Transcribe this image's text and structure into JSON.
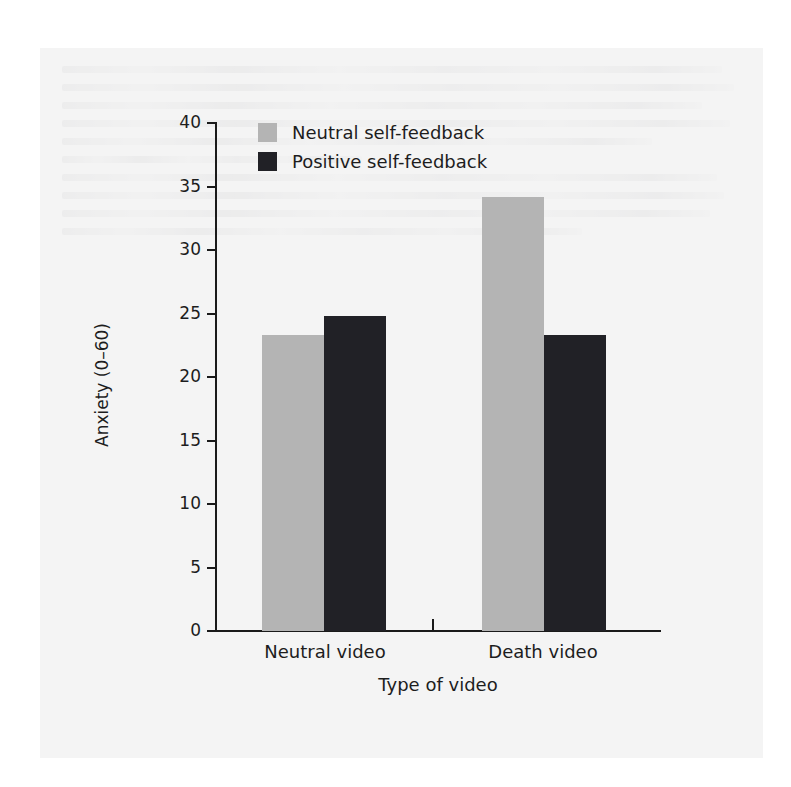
{
  "chart_data": {
    "type": "bar",
    "title": "",
    "xlabel": "Type of video",
    "ylabel": "Anxiety (0–60)",
    "categories": [
      "Neutral video",
      "Death video"
    ],
    "series": [
      {
        "name": "Neutral self-feedback",
        "color": "#b4b4b4",
        "values": [
          23.3,
          34.2
        ]
      },
      {
        "name": "Positive self-feedback",
        "color": "#212126",
        "values": [
          24.8,
          23.3
        ]
      }
    ],
    "ylim": [
      0,
      40
    ],
    "yticks": [
      0,
      5,
      10,
      15,
      20,
      25,
      30,
      35,
      40
    ],
    "ytick_labels": [
      "0",
      "5",
      "10",
      "15",
      "20",
      "25",
      "30",
      "35",
      "40"
    ],
    "grid": false,
    "legend_position": "top-left-inside",
    "axis_color": "#1a1a1a",
    "background_color": "#f4f4f4"
  },
  "legend": {
    "entries": [
      {
        "label": "Neutral self-feedback",
        "color": "#b4b4b4"
      },
      {
        "label": "Positive self-feedback",
        "color": "#212126"
      }
    ]
  },
  "axes": {
    "y_title": "Anxiety (0–60)",
    "x_title": "Type of video",
    "y_ticks": [
      "40",
      "35",
      "30",
      "25",
      "20",
      "15",
      "10",
      "5",
      "0"
    ],
    "x_groups": [
      "Neutral video",
      "Death video"
    ]
  }
}
